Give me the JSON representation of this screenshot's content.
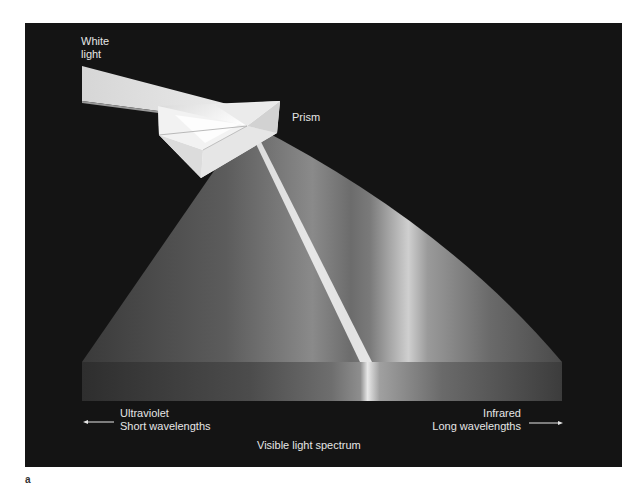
{
  "figure": {
    "panel_label": "a",
    "background_color": "#141414",
    "labels": {
      "white_light": [
        "White",
        "light"
      ],
      "prism": "Prism",
      "ultraviolet": "Ultraviolet",
      "short_wavelengths": "Short wavelengths",
      "infrared": "Infrared",
      "long_wavelengths": "Long wavelengths",
      "visible_spectrum": "Visible light spectrum"
    },
    "arrows": {
      "left": "arrow-left-icon",
      "right": "arrow-right-icon"
    },
    "colors": {
      "beam": "#e2e2e2",
      "prism_light": "#f4f4f4",
      "prism_shadow": "#bdbdbd",
      "spectrum_peak": "#ffffff",
      "spectrum_base": "#5a5a5a",
      "text": "#e6e6e6"
    }
  }
}
